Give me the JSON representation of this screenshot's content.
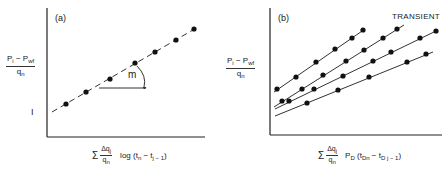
{
  "chart_data": [
    {
      "type": "line",
      "panel_label": "(a)",
      "title": "",
      "ylabel": "(Pi - Pwf) / qn",
      "xlabel": "Σ (Δqj / qn) log(tn - tj-1)",
      "annotations": [
        "m (slope)",
        "I (intercept)"
      ],
      "grid": false,
      "series": [
        {
          "name": "data",
          "style": "dashed line with points",
          "points_px": [
            [
              66,
              104
            ],
            [
              86,
              92
            ],
            [
              110,
              79
            ],
            [
              135,
              63
            ],
            [
              155,
              52
            ],
            [
              176,
              40
            ],
            [
              194,
              29
            ]
          ],
          "line_px": [
            [
              52,
              112
            ],
            [
              198,
              27
            ]
          ]
        }
      ]
    },
    {
      "type": "line",
      "panel_label": "(b)",
      "title": "TRANSIENT",
      "ylabel": "(Pi - Pwf) / qn",
      "xlabel": "Σ (Δqj / qn) PD(tDn - tDj-1)",
      "grid": false,
      "series": [
        {
          "name": "line 1",
          "points_px": [
            [
              277,
              89
            ],
            [
              296,
              77
            ],
            [
              316,
              62
            ],
            [
              335,
              49
            ],
            [
              352,
              38
            ],
            [
              363,
              30
            ]
          ],
          "line_px": [
            [
              274,
              92
            ],
            [
              365,
              29
            ]
          ]
        },
        {
          "name": "line 2",
          "points_px": [
            [
              282,
              101
            ],
            [
              302,
              89
            ],
            [
              323,
              75
            ],
            [
              346,
              61
            ],
            [
              364,
              50
            ],
            [
              383,
              38
            ],
            [
              397,
              29
            ]
          ],
          "line_px": [
            [
              274,
              107
            ],
            [
              404,
              25
            ]
          ]
        },
        {
          "name": "line 3",
          "points_px": [
            [
              289,
              101
            ],
            [
              314,
              89
            ],
            [
              343,
              76
            ],
            [
              373,
              61
            ],
            [
              391,
              52
            ],
            [
              420,
              38
            ],
            [
              436,
              31
            ]
          ],
          "line_px": [
            [
              275,
              109
            ],
            [
              436,
              31
            ]
          ]
        },
        {
          "name": "line 4",
          "points_px": [
            [
              307,
              103
            ],
            [
              338,
              90
            ],
            [
              369,
              77
            ],
            [
              407,
              62
            ],
            [
              426,
              54
            ]
          ],
          "line_px": [
            [
              275,
              116
            ],
            [
              433,
              52
            ]
          ]
        }
      ]
    }
  ],
  "labels": {
    "panel_a": "(a)",
    "panel_b": "(b)",
    "transient": "TRANSIENT",
    "slope": "m",
    "intercept": "I",
    "y_num_a": "P",
    "y_num_sub_i": "i",
    "y_minus": " − P",
    "y_num_sub_wf": "wf",
    "y_den": "q",
    "y_den_sub": "n",
    "sigma": "Σ",
    "x_frac_num": "Δq",
    "x_frac_num_sub": "j",
    "x_frac_den": "q",
    "x_frac_den_sub": "n",
    "x_a_func": "log (t",
    "x_a_sub1": "n",
    "x_a_mid": " − t",
    "x_a_sub2": "j − 1",
    "x_a_close": ")",
    "x_b_func": "P",
    "x_b_func_sub": "D",
    "x_b_open": " (t",
    "x_b_sub1": "Dn",
    "x_b_mid": " − t",
    "x_b_sub2": "D j − 1",
    "x_b_close": ")"
  }
}
